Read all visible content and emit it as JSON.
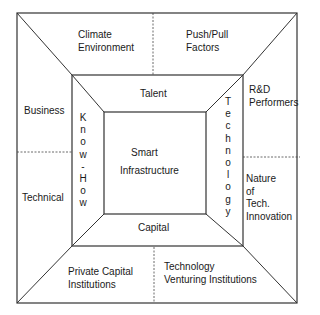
{
  "diagram": {
    "center": {
      "line1": "Smart",
      "line2": "Infrastructure"
    },
    "inner_ring": {
      "top": "Talent",
      "bottom": "Capital",
      "left": "K\nn\no\nw\n-\nH\no\nw",
      "right": "T\ne\nc\nh\nn\no\nl\no\ng\ny"
    },
    "outer_ring": {
      "top_left": "Climate\nEnvironment",
      "top_right": "Push/Pull\nFactors",
      "left_top": "Business",
      "left_bottom": "Technical",
      "right_top": "R&D\nPerformers",
      "right_bottom": "Nature\nof\nTech.\nInnovation",
      "bottom_left": "Private Capital\nInstitutions",
      "bottom_right": "Technology\nVenturing Institutions"
    },
    "colors": {
      "line": "#333333",
      "background": "#ffffff"
    }
  }
}
